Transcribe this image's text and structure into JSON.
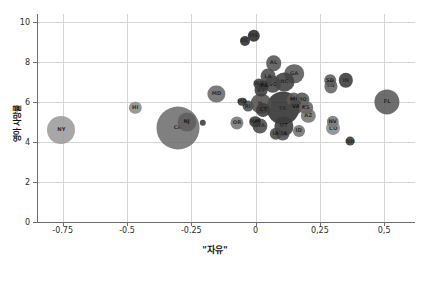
{
  "chart_data": {
    "type": "scatter",
    "title": "",
    "xlabel": "\"자유\"",
    "ylabel": "영아 사망률",
    "xlim": [
      -0.85,
      0.62
    ],
    "ylim": [
      0,
      10.4
    ],
    "xticks": [
      "-0.75",
      "-0.5",
      "-0.25",
      "0",
      "0,25",
      "0,5"
    ],
    "xtick_values": [
      -0.75,
      -0.5,
      -0.25,
      0,
      0.25,
      0.5
    ],
    "yticks": [
      "0",
      "2",
      "4",
      "6",
      "8",
      "10"
    ],
    "ytick_values": [
      0,
      2,
      4,
      6,
      8,
      10
    ],
    "grid": true,
    "legend": "none",
    "size_encodes": "bubble area",
    "points": [
      {
        "label": "NY",
        "x": -0.755,
        "y": 4.62,
        "r": 14.0,
        "color": "#9c9c9c"
      },
      {
        "label": "HI",
        "x": -0.468,
        "y": 5.72,
        "r": 6.2,
        "color": "#8c8c8c"
      },
      {
        "label": "CA",
        "x": -0.303,
        "y": 4.72,
        "r": 21.5,
        "color": "#6f6f6f"
      },
      {
        "label": "NJ",
        "x": -0.268,
        "y": 5.02,
        "r": 9.5,
        "color": "#5f5f5f"
      },
      {
        "label": "",
        "x": -0.205,
        "y": 4.95,
        "r": 3.2,
        "color": "#3a3a3a"
      },
      {
        "label": "MD",
        "x": -0.152,
        "y": 6.42,
        "r": 8.6,
        "color": "#6b6b6b"
      },
      {
        "label": "OR",
        "x": -0.072,
        "y": 4.95,
        "r": 6.6,
        "color": "#777777"
      },
      {
        "label": "DE",
        "x": -0.043,
        "y": 9.05,
        "r": 5.0,
        "color": "#2e2e2e"
      },
      {
        "label": "MS",
        "x": -0.008,
        "y": 9.32,
        "r": 6.2,
        "color": "#2a2a2a"
      },
      {
        "label": "RI",
        "x": -0.03,
        "y": 5.78,
        "r": 5.4,
        "color": "#4d4d4d"
      },
      {
        "label": "MD",
        "x": -0.052,
        "y": 6.02,
        "r": 4.3,
        "color": "#3a3a3a"
      },
      {
        "label": "WV",
        "x": 0.012,
        "y": 6.92,
        "r": 5.6,
        "color": "#404040"
      },
      {
        "label": "KY",
        "x": 0.022,
        "y": 6.58,
        "r": 6.4,
        "color": "#3d3d3d"
      },
      {
        "label": "LA",
        "x": 0.048,
        "y": 7.3,
        "r": 7.4,
        "color": "#4a4a4a"
      },
      {
        "label": "AL",
        "x": 0.07,
        "y": 7.95,
        "r": 7.8,
        "color": "#555555"
      },
      {
        "label": "PA",
        "x": 0.033,
        "y": 6.82,
        "r": 5.2,
        "color": "#3b3b3b"
      },
      {
        "label": "SC",
        "x": 0.066,
        "y": 6.88,
        "r": 8.2,
        "color": "#464646"
      },
      {
        "label": "NC",
        "x": 0.112,
        "y": 7.02,
        "r": 9.6,
        "color": "#3f3f3f"
      },
      {
        "label": "GA",
        "x": 0.15,
        "y": 7.42,
        "r": 9.8,
        "color": "#5a5a5a"
      },
      {
        "label": "IL",
        "x": 0.02,
        "y": 5.92,
        "r": 10.4,
        "color": "#525252"
      },
      {
        "label": "CT",
        "x": 0.03,
        "y": 5.62,
        "r": 7.0,
        "color": "#3d3d3d"
      },
      {
        "label": "NM",
        "x": -0.002,
        "y": 5.02,
        "r": 5.8,
        "color": "#3a3a3a"
      },
      {
        "label": "WA",
        "x": 0.018,
        "y": 4.82,
        "r": 7.6,
        "color": "#4a4a4a"
      },
      {
        "label": "MI",
        "x": 0.148,
        "y": 6.12,
        "r": 7.4,
        "color": "#5b5b5b"
      },
      {
        "label": "MO",
        "x": 0.18,
        "y": 6.12,
        "r": 7.6,
        "color": "#565656"
      },
      {
        "label": "VA",
        "x": 0.157,
        "y": 5.75,
        "r": 7.0,
        "color": "#484848"
      },
      {
        "label": "KS",
        "x": 0.196,
        "y": 5.72,
        "r": 6.8,
        "color": "#666666"
      },
      {
        "label": "AZ",
        "x": 0.205,
        "y": 5.32,
        "r": 7.2,
        "color": "#767676"
      },
      {
        "label": "TX",
        "x": 0.105,
        "y": 5.7,
        "r": 16.5,
        "color": "#2f2f2f"
      },
      {
        "label": "UT",
        "x": 0.11,
        "y": 4.78,
        "r": 9.6,
        "color": "#3c3c3c"
      },
      {
        "label": "ID",
        "x": 0.168,
        "y": 4.55,
        "r": 6.0,
        "color": "#707070"
      },
      {
        "label": "IA",
        "x": 0.078,
        "y": 4.42,
        "r": 6.2,
        "color": "#484848"
      },
      {
        "label": "MA",
        "x": 0.105,
        "y": 4.42,
        "r": 7.4,
        "color": "#4f4f4f"
      },
      {
        "label": "SD",
        "x": 0.29,
        "y": 7.08,
        "r": 5.8,
        "color": "#5d5d5d"
      },
      {
        "label": "TN",
        "x": 0.292,
        "y": 6.78,
        "r": 6.6,
        "color": "#626262"
      },
      {
        "label": "IN",
        "x": 0.352,
        "y": 7.08,
        "r": 7.2,
        "color": "#3a3a3a"
      },
      {
        "label": "NV",
        "x": 0.3,
        "y": 5.02,
        "r": 6.2,
        "color": "#7a7a7a"
      },
      {
        "label": "CO",
        "x": 0.302,
        "y": 4.68,
        "r": 7.0,
        "color": "#8a8a8a"
      },
      {
        "label": "NH",
        "x": 0.368,
        "y": 4.06,
        "r": 4.4,
        "color": "#3a3a3a"
      },
      {
        "label": "FL",
        "x": 0.512,
        "y": 6.02,
        "r": 12.6,
        "color": "#5a5a5a"
      }
    ]
  }
}
